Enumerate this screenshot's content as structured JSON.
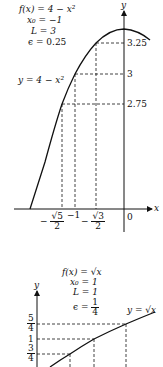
{
  "figures": [
    {
      "id": "top",
      "function_label": "f(x) = 4 − x²",
      "params": {
        "f": "f(x) = 4 − x²",
        "x0": "x₀ = −1",
        "L": "L = 3",
        "epsilon": "ϵ = 0.25"
      },
      "curve_label": "y = 4 − x²",
      "axis_labels": {
        "x": "x",
        "y": "y"
      },
      "y_ticks": [
        "3.25",
        "3",
        "2.75"
      ],
      "x_ticks": {
        "neg_sqrt5_over_2": {
          "sign": "−",
          "num": "√5",
          "den": "2"
        },
        "minus_one": "−1",
        "neg_sqrt3_over_2": {
          "sign": "−",
          "num": "√3",
          "den": "2"
        },
        "zero": "0"
      }
    },
    {
      "id": "bottom",
      "params": {
        "f": "f(x) = √x",
        "x0": "x₀ = 1",
        "L": "L = 1",
        "epsilon_prefix": "ϵ =",
        "epsilon_num": "1",
        "epsilon_den": "4"
      },
      "curve_label": "y = √x",
      "axis_labels": {
        "y": "y"
      },
      "y_ticks": {
        "five_fourths": {
          "num": "5",
          "den": "4"
        },
        "one": "1",
        "three_fourths": {
          "num": "3",
          "den": "4"
        }
      }
    }
  ],
  "colors": {
    "ink": "#111111",
    "background": "#ffffff"
  }
}
